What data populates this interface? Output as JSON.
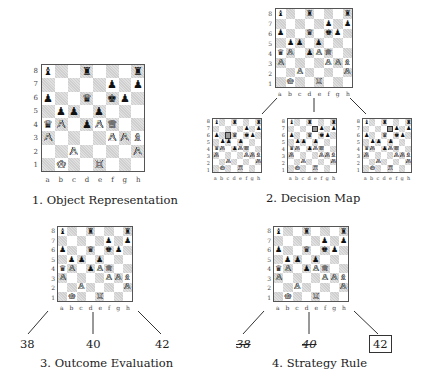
{
  "main_position": {
    "rows": [
      [
        "b:bishop",
        "",
        "",
        "b:rook",
        "",
        "",
        "",
        "b:rook"
      ],
      [
        "",
        "",
        "",
        "",
        "",
        "b:pawn",
        "",
        "b:pawn"
      ],
      [
        "b:pawn",
        "",
        "",
        "b:queen",
        "",
        "b:king",
        "b:pawn",
        ""
      ],
      [
        "",
        "b:pawn",
        "b:pawn",
        "",
        "b:pawn",
        "",
        "",
        ""
      ],
      [
        "b:queen",
        "w:pawn",
        "",
        "b:pawn",
        "w:pawn",
        "w:queen",
        "",
        ""
      ],
      [
        "w:pawn",
        "",
        "",
        "",
        "",
        "w:pawn",
        "w:pawn",
        "w:bishop"
      ],
      [
        "",
        "",
        "w:pawn",
        "",
        "",
        "",
        "",
        "w:pawn"
      ],
      [
        "",
        "w:king",
        "",
        "",
        "w:rook",
        "",
        "",
        ""
      ]
    ]
  },
  "rank_labels": [
    "8",
    "7",
    "6",
    "5",
    "4",
    "3",
    "2",
    "1"
  ],
  "file_labels": [
    "a",
    "b",
    "c",
    "d",
    "e",
    "f",
    "g",
    "h"
  ],
  "panels": {
    "object_representation": {
      "caption": "1. Object Representation"
    },
    "decision_map": {
      "caption": "2. Decision Map",
      "children": [
        {
          "name": "option-a",
          "highlight": "c6"
        },
        {
          "name": "option-d",
          "highlight": "e7"
        },
        {
          "name": "option-h",
          "highlight": "e7"
        }
      ]
    },
    "outcome_evaluation": {
      "caption": "3. Outcome Evaluation",
      "outcomes": [
        "38",
        "40",
        "42"
      ]
    },
    "strategy_rule": {
      "caption": "4. Strategy Rule",
      "outcomes": [
        {
          "value": "38",
          "state": "rejected"
        },
        {
          "value": "40",
          "state": "rejected"
        },
        {
          "value": "42",
          "state": "selected"
        }
      ]
    }
  },
  "glyphs": {
    "w": {
      "king": "♔",
      "queen": "♕",
      "rook": "♖",
      "bishop": "♗",
      "knight": "♘",
      "pawn": "♙"
    },
    "b": {
      "king": "♚",
      "queen": "♛",
      "rook": "♜",
      "bishop": "♝",
      "knight": "♞",
      "pawn": "♟"
    }
  },
  "colors": {
    "dark_square": "#cfcfcf",
    "light_square": "#ffffff",
    "line": "#333333"
  }
}
